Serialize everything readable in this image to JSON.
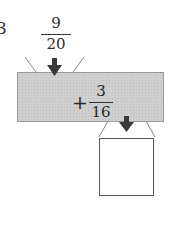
{
  "problem": {
    "number": "3"
  },
  "input": {
    "numerator": "9",
    "denominator": "20"
  },
  "machine": {
    "operator": "+",
    "operand_numerator": "3",
    "operand_denominator": "16",
    "fill_color": "#cfcfcf"
  },
  "output": {
    "value": ""
  },
  "icons": {
    "input_arrow": "arrow-down-icon",
    "output_arrow": "arrow-down-icon"
  },
  "colors": {
    "arrow": "#3a3a3a",
    "line": "#888888"
  }
}
